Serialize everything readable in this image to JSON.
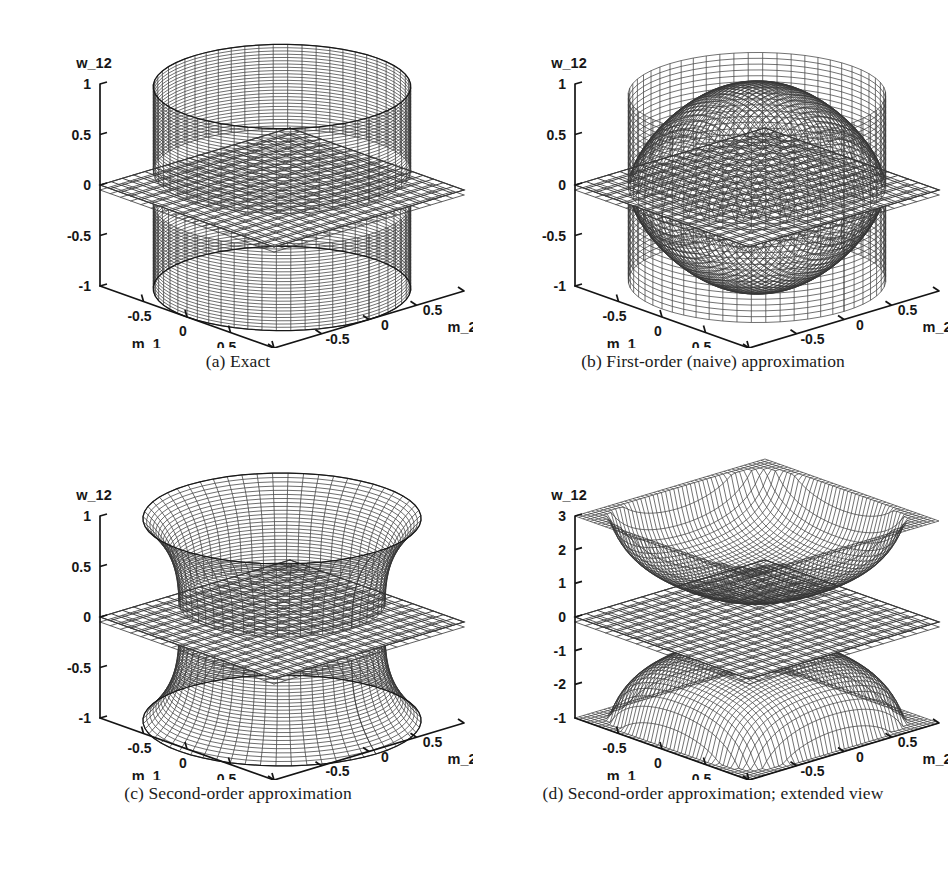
{
  "page": {
    "number": ""
  },
  "figure": {
    "title": "",
    "panels": [
      {
        "id": "a",
        "caption": "(a) Exact",
        "zlabel": "w_12",
        "xlabel": "m_1",
        "ylabel": "m_2",
        "zticks": [
          "1",
          "0.5",
          "0",
          "-0.5",
          "-1"
        ],
        "xticks": [
          "-0.5",
          "0",
          "0.5",
          "1"
        ],
        "yticks": [
          "-1",
          "-0.5",
          "0",
          "0.5",
          "1"
        ]
      },
      {
        "id": "b",
        "caption": "(b) First-order (naive) approximation",
        "zlabel": "w_12",
        "xlabel": "m_1",
        "ylabel": "m_2",
        "zticks": [
          "1",
          "0.5",
          "0",
          "-0.5",
          "-1"
        ],
        "xticks": [
          "-0.5",
          "0",
          "0.5",
          "1"
        ],
        "yticks": [
          "-1",
          "-0.5",
          "0",
          "0.5",
          "1"
        ]
      },
      {
        "id": "c",
        "caption": "(c) Second-order approximation",
        "zlabel": "w_12",
        "xlabel": "m_1",
        "ylabel": "m_2",
        "zticks": [
          "1",
          "0.5",
          "0",
          "-0.5",
          "-1"
        ],
        "xticks": [
          "-0.5",
          "0",
          "0.5",
          "1"
        ],
        "yticks": [
          "-1",
          "-0.5",
          "0",
          "0.5",
          "1"
        ]
      },
      {
        "id": "d",
        "caption": "(d) Second-order approximation; extended view",
        "zlabel": "w_12",
        "xlabel": "m_1",
        "ylabel": "m_2",
        "zticks": [
          "3",
          "2",
          "1",
          "0",
          "-1",
          "-2",
          "-1"
        ],
        "xticks": [
          "-0.5",
          "0",
          "0.5",
          "1"
        ],
        "yticks": [
          "-1",
          "-0.5",
          "0",
          "0.5",
          "1"
        ]
      }
    ]
  },
  "chart_data": [
    {
      "type": "surface",
      "panel": "a",
      "title": "(a) Exact",
      "xlabel": "m_1",
      "ylabel": "m_2",
      "zlabel": "w_12",
      "xlim": [
        -1,
        1
      ],
      "ylim": [
        -1,
        1
      ],
      "zlim": [
        -1,
        1
      ],
      "xticks": [
        -1,
        -0.5,
        0,
        0.5,
        1
      ],
      "yticks": [
        -1,
        -0.5,
        0,
        0.5,
        1
      ],
      "zticks": [
        -1,
        -0.5,
        0,
        0.5,
        1
      ],
      "grid": false,
      "legend": "none",
      "surfaces": [
        {
          "name": "upper branch (exact)",
          "formula": "w = +1 on unit disk (vertical cylinder wall)",
          "zrange": [
            0.18,
            1.0
          ]
        },
        {
          "name": "lower branch (exact)",
          "formula": "w = -1 on unit disk (vertical cylinder wall)",
          "zrange": [
            -1.0,
            -0.18
          ]
        },
        {
          "name": "zero plane",
          "formula": "w = 0",
          "zrange": [
            0,
            0
          ]
        }
      ],
      "annotations": [
        "Cylindrical two-sheet surface cut by the w_12 = 0 reference plane"
      ]
    },
    {
      "type": "surface",
      "panel": "b",
      "title": "(b) First-order (naive) approximation",
      "xlabel": "m_1",
      "ylabel": "m_2",
      "zlabel": "w_12",
      "xlim": [
        -1,
        1
      ],
      "ylim": [
        -1,
        1
      ],
      "zlim": [
        -1,
        1
      ],
      "xticks": [
        -1,
        -0.5,
        0,
        0.5,
        1
      ],
      "yticks": [
        -1,
        -0.5,
        0,
        0.5,
        1
      ],
      "zticks": [
        -1,
        -0.5,
        0,
        0.5,
        1
      ],
      "grid": false,
      "legend": "none",
      "surfaces": [
        {
          "name": "upper branch (first-order)",
          "formula": "dome peaking near w = 1 at m_1 = m_2 = 0, falling to 0 at |m| = 1",
          "zrange": [
            0.0,
            1.0
          ]
        },
        {
          "name": "lower branch (first-order)",
          "formula": "mirrored dome, minimum near w = -1",
          "zrange": [
            -1.0,
            0.0
          ]
        },
        {
          "name": "zero plane",
          "formula": "w = 0",
          "zrange": [
            0,
            0
          ]
        }
      ],
      "annotations": [
        "Rounded dome/bell shape; surface collapses to the plane at the domain boundary"
      ]
    },
    {
      "type": "surface",
      "panel": "c",
      "title": "(c) Second-order approximation",
      "xlabel": "m_1",
      "ylabel": "m_2",
      "zlabel": "w_12",
      "xlim": [
        -1,
        1
      ],
      "ylim": [
        -1,
        1
      ],
      "zlim": [
        -1,
        1
      ],
      "xticks": [
        -1,
        -0.5,
        0,
        0.5,
        1
      ],
      "yticks": [
        -1,
        -0.5,
        0,
        0.5,
        1
      ],
      "zticks": [
        -1,
        -0.5,
        0,
        0.5,
        1
      ],
      "grid": false,
      "legend": "none",
      "surfaces": [
        {
          "name": "upper branch (second-order)",
          "formula": "waisted cylinder, flaring above w ≈ 0.75 toward w = 1",
          "zrange": [
            0.2,
            1.0
          ]
        },
        {
          "name": "lower branch (second-order)",
          "formula": "mirrored waisted cylinder",
          "zrange": [
            -1.0,
            -0.2
          ]
        },
        {
          "name": "zero plane",
          "formula": "w = 0",
          "zrange": [
            0,
            0
          ]
        }
      ],
      "annotations": [
        "Hourglass / waisted cylinder closely matching the exact cylinder in (a)"
      ]
    },
    {
      "type": "surface",
      "panel": "d",
      "title": "(d) Second-order approximation; extended view",
      "xlabel": "m_1",
      "ylabel": "m_2",
      "zlabel": "w_12",
      "xlim": [
        -1,
        1
      ],
      "ylim": [
        -1,
        1
      ],
      "zlim": [
        -3,
        3
      ],
      "xticks": [
        -1,
        -0.5,
        0,
        0.5,
        1
      ],
      "yticks": [
        -1,
        -0.5,
        0,
        0.5,
        1
      ],
      "zticks": [
        -2,
        -1,
        0,
        1,
        2,
        3
      ],
      "grid": false,
      "legend": "none",
      "surfaces": [
        {
          "name": "upper branch (extended)",
          "formula": "saddle-like sheet rising to w ≈ 3 at the domain corners, dipping to w ≈ 1 near the centre ridge",
          "zrange": [
            0.9,
            3.0
          ]
        },
        {
          "name": "lower branch (extended)",
          "formula": "mirrored sheet falling to w ≈ -3",
          "zrange": [
            -3.0,
            -0.9
          ]
        },
        {
          "name": "zero plane",
          "formula": "w = 0",
          "zrange": [
            0,
            0
          ]
        }
      ],
      "annotations": [
        "Extended vertical range reveals the divergence of the second-order branches away from the plane"
      ]
    }
  ]
}
